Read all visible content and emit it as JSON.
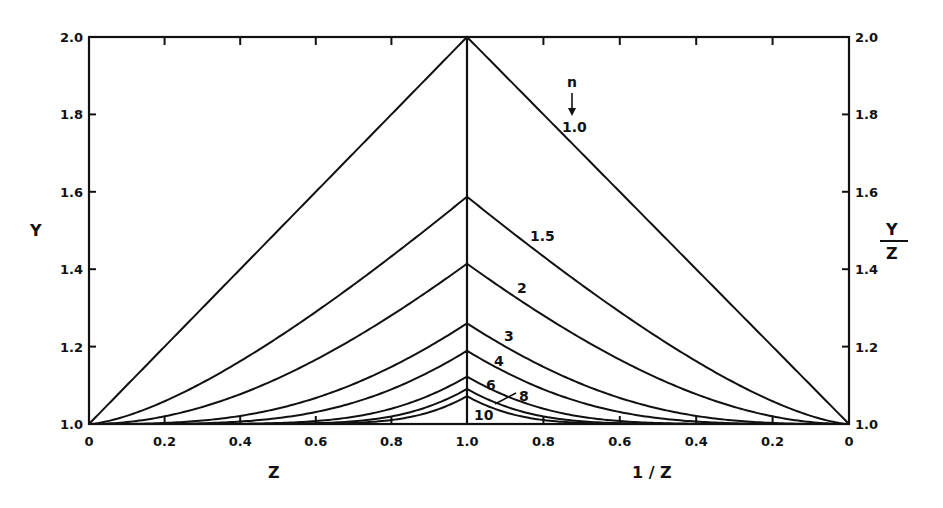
{
  "chart_data": {
    "type": "line",
    "title": "",
    "left_panel": {
      "xlabel": "Z",
      "ylabel": "Y",
      "xlim": [
        0,
        1.0
      ],
      "x_ticks": [
        "0",
        "0.2",
        "0.4",
        "0.6",
        "0.8",
        "1.0"
      ],
      "ylim": [
        1.0,
        2.0
      ],
      "y_ticks": [
        "1.0",
        "1.2",
        "1.4",
        "1.6",
        "1.8",
        "2.0"
      ]
    },
    "right_panel": {
      "xlabel": "1 / Z",
      "ylabel_num": "Y",
      "ylabel_den": "Z",
      "xlim": [
        1.0,
        0
      ],
      "x_ticks": [
        "0.8",
        "0.6",
        "0.4",
        "0.2",
        "0"
      ],
      "ylim": [
        1.0,
        2.0
      ],
      "y_ticks": [
        "1.0",
        "1.2",
        "1.4",
        "1.6",
        "1.8",
        "2.0"
      ]
    },
    "legend_header": "n",
    "series": [
      {
        "name": "1.0",
        "n": 1.0,
        "peak": 2.0
      },
      {
        "name": "1.5",
        "n": 1.5,
        "peak": 1.587
      },
      {
        "name": "2",
        "n": 2,
        "peak": 1.414
      },
      {
        "name": "3",
        "n": 3,
        "peak": 1.26
      },
      {
        "name": "4",
        "n": 4,
        "peak": 1.189
      },
      {
        "name": "6",
        "n": 6,
        "peak": 1.122
      },
      {
        "name": "8",
        "n": 8,
        "peak": 1.091
      },
      {
        "name": "10",
        "n": 10,
        "peak": 1.072
      }
    ],
    "x_sample": [
      0,
      0.2,
      0.4,
      0.6,
      0.8,
      1.0
    ],
    "values_at_samples": {
      "1.0": [
        1.0,
        1.2,
        1.4,
        1.6,
        1.8,
        2.0
      ],
      "1.5": [
        1.0,
        1.058,
        1.152,
        1.276,
        1.424,
        1.587
      ],
      "2": [
        1.0,
        1.02,
        1.077,
        1.166,
        1.281,
        1.414
      ],
      "3": [
        1.0,
        1.003,
        1.021,
        1.069,
        1.154,
        1.26
      ],
      "4": [
        1.0,
        1.0004,
        1.006,
        1.031,
        1.094,
        1.189
      ],
      "6": [
        1.0,
        1.0,
        1.001,
        1.007,
        1.039,
        1.122
      ],
      "8": [
        1.0,
        1.0,
        1.0,
        1.002,
        1.019,
        1.091
      ],
      "10": [
        1.0,
        1.0,
        1.0,
        1.0,
        1.01,
        1.072
      ]
    },
    "grid": false,
    "legend_position": "inline labels on right half"
  },
  "labels": {
    "y_left": "Y",
    "x_left": "Z",
    "x_right": "1 / Z",
    "y_right_num": "Y",
    "y_right_den": "Z",
    "n_header": "n"
  }
}
